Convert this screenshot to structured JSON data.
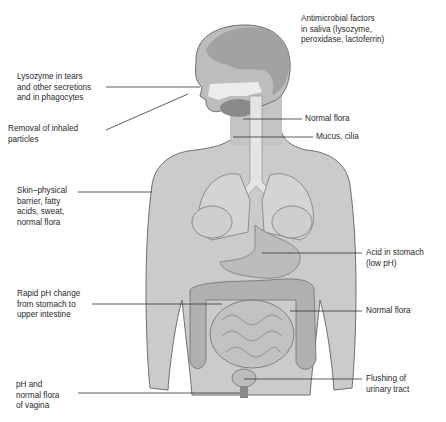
{
  "figure": {
    "colors": {
      "background": "#ffffff",
      "skin_fill": "#c9c9c9",
      "skin_shade": "#a9a9a9",
      "outline": "#6e6e6e",
      "organ_fill": "#b8b8b8",
      "airway_fill": "#e6e6e6",
      "leader_line": "#333333",
      "text": "#2a2a2a"
    }
  },
  "labels": {
    "saliva": {
      "lines": [
        "Antimicrobial factors",
        "in saliva (lysozyme,",
        "peroxidase, lactoferrin)"
      ]
    },
    "lysozyme_tears": {
      "lines": [
        "Lysozyme in tears",
        "and other secretions",
        "and in phagocytes"
      ]
    },
    "inhaled_particles": {
      "lines": [
        "Removal of inhaled",
        "particles"
      ]
    },
    "normal_flora_throat": {
      "lines": [
        "Normal flora"
      ]
    },
    "mucus_cilia": {
      "lines": [
        "Mucus, cilia"
      ]
    },
    "skin": {
      "lines": [
        "Skin–physical",
        "barrier, fatty",
        "acids, sweat,",
        "normal flora"
      ]
    },
    "stomach_acid": {
      "lines": [
        "Acid in stomach",
        "(low pH)"
      ]
    },
    "rapid_ph": {
      "lines": [
        "Rapid pH change",
        "from stomach to",
        "upper intestine"
      ]
    },
    "normal_flora_colon": {
      "lines": [
        "Normal flora"
      ]
    },
    "urinary": {
      "lines": [
        "Flushing of",
        "urinary tract"
      ]
    },
    "vagina": {
      "lines": [
        "pH and",
        "normal flora",
        "of vagina"
      ]
    }
  }
}
